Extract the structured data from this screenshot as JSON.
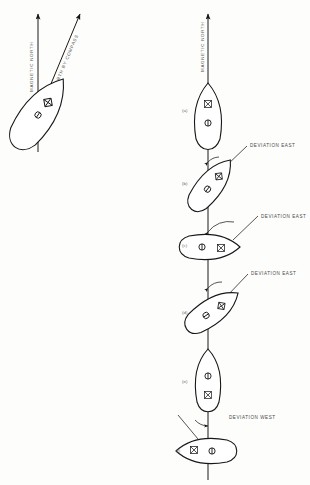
{
  "figure": {
    "background": "#fdfdfc",
    "ink_color": "#1a1a1a",
    "label_color": "#4a4a4a"
  },
  "left_panel": {
    "name": "compass-deviation-detail",
    "axes": [
      {
        "id": "magnetic-north",
        "label": "MAGNETIC NORTH",
        "angle_deg": 0
      },
      {
        "id": "north-by-compass",
        "label": "NORTH BY COMPASS",
        "angle_deg": 28
      }
    ],
    "vessel": {
      "id": "vessel-detail",
      "heading_deg": 35,
      "markers": [
        {
          "id": "compass-rose",
          "symbol": "diamond-cross"
        },
        {
          "id": "pivot-point",
          "symbol": "circle-line"
        }
      ]
    }
  },
  "right_panel": {
    "name": "deviation-sequence",
    "axis": {
      "id": "magnetic-north",
      "label": "MAGNETIC NORTH",
      "angle_deg": 0
    },
    "vessels": [
      {
        "index": "(a)",
        "heading_deg": 0,
        "deviation": "",
        "deviation_side": "none"
      },
      {
        "index": "(b)",
        "heading_deg": 38,
        "deviation": "DEVIATION EAST",
        "deviation_side": "east"
      },
      {
        "index": "(c)",
        "heading_deg": 90,
        "deviation": "DEVIATION EAST",
        "deviation_side": "east"
      },
      {
        "index": "(d)",
        "heading_deg": 55,
        "deviation": "DEVIATION EAST",
        "deviation_side": "east"
      },
      {
        "index": "(e)",
        "heading_deg": 0,
        "deviation": "",
        "deviation_side": "none"
      },
      {
        "index": "(f)",
        "heading_deg": 270,
        "deviation": "DEVIATION WEST",
        "deviation_side": "west"
      }
    ]
  }
}
